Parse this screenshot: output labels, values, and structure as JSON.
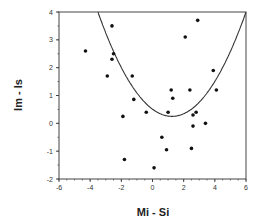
{
  "chart_data": {
    "type": "scatter",
    "title": "",
    "xlabel": "Mi - Si",
    "ylabel": "Im - Is",
    "xlim": [
      -6,
      6
    ],
    "ylim": [
      -2,
      4
    ],
    "xticks": [
      "-6",
      "-4",
      "-2",
      "0",
      "2",
      "4",
      "6"
    ],
    "yticks": [
      "-2",
      "-1",
      "0",
      "1",
      "2",
      "3",
      "4"
    ],
    "grid": false,
    "legend": null,
    "series": [
      {
        "name": "points",
        "points": [
          [
            -4.3,
            2.6
          ],
          [
            -2.6,
            3.5
          ],
          [
            -2.5,
            2.5
          ],
          [
            -2.6,
            2.3
          ],
          [
            -2.9,
            1.7
          ],
          [
            -1.3,
            1.7
          ],
          [
            -1.2,
            0.86
          ],
          [
            -0.4,
            0.4
          ],
          [
            -1.9,
            0.25
          ],
          [
            -1.8,
            -1.3
          ],
          [
            0.1,
            -1.6
          ],
          [
            0.6,
            -0.5
          ],
          [
            0.9,
            -0.95
          ],
          [
            1.0,
            0.4
          ],
          [
            1.2,
            1.2
          ],
          [
            1.3,
            0.9
          ],
          [
            2.4,
            1.2
          ],
          [
            2.1,
            3.1
          ],
          [
            2.9,
            3.7
          ],
          [
            3.9,
            1.9
          ],
          [
            4.1,
            1.2
          ],
          [
            2.6,
            0.3
          ],
          [
            2.8,
            0.4
          ],
          [
            2.6,
            -0.1
          ],
          [
            3.4,
            0.0
          ],
          [
            2.5,
            -0.9
          ]
        ]
      },
      {
        "name": "fitted curve",
        "type": "line",
        "formula": "y = 0.166*(x-1.25)^2 + 0.25",
        "vertex": [
          1.25,
          0.25
        ]
      }
    ]
  }
}
